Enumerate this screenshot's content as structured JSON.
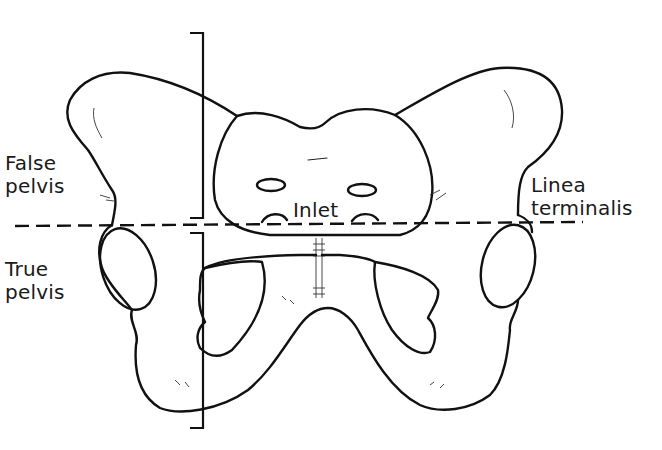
{
  "figure": {
    "background_color": "#ffffff",
    "ink_color": "#111111"
  },
  "labels": {
    "false_pelvis": {
      "line1": "False",
      "line2": "pelvis"
    },
    "true_pelvis": {
      "line1": "True",
      "line2": "pelvis"
    },
    "inlet": "Inlet",
    "linea_terminalis": {
      "line1": "Linea",
      "line2": "terminalis"
    }
  },
  "annotations": {
    "dashed_line": {
      "name": "pelvic brim plane",
      "y": 226,
      "x_start": 15,
      "x_end": 583
    },
    "bracket_false_pelvis": {
      "x": 203,
      "y_top": 33,
      "y_bottom": 218
    },
    "bracket_true_pelvis": {
      "x": 203,
      "y_top": 233,
      "y_bottom": 428
    }
  }
}
